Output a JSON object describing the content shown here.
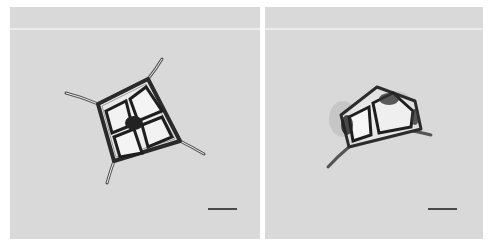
{
  "figure": {
    "panels": [
      {
        "id": "left",
        "subject": "quadrangular diatom cell with four corner setae and four internal chambers",
        "scale_bar": {
          "visible": true,
          "color": "#4a4a4a"
        }
      },
      {
        "id": "right",
        "subject": "distorted diatom cell with irregular chambers",
        "scale_bar": {
          "visible": true,
          "color": "#4a4a4a"
        }
      }
    ],
    "background_color": "#d9d9d9"
  }
}
